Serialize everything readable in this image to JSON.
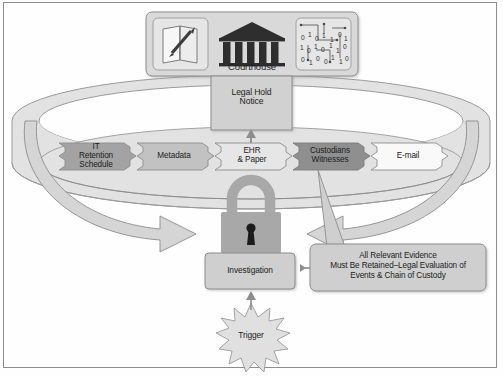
{
  "diagram": {
    "colors": {
      "page_background": "#fefefe",
      "frame_border": "#8e8e8e",
      "ring_fill": "#e2e2e2",
      "ring_stroke": "#9a9a9a",
      "panel_fill": "#d9d9d9",
      "panel_stroke": "#8d8d8d",
      "icon_tile_fill": "#e6e6e6",
      "chevron_light": "#e0e0e0",
      "chevron_mid": "#c2c2c2",
      "chevron_dark": "#a3a3a3",
      "chevron_white": "#f7f7f7",
      "arrow_fill": "#d5d5d5",
      "arrow_stroke": "#8d8d8d",
      "lock_fill": "#a8a8a8",
      "lock_keyhole": "#1c1c1c",
      "box_fill": "#cfcfcf",
      "box_stroke": "#8d8d8d",
      "starburst_fill": "#e0e0e0",
      "text": "#1c1c1c"
    },
    "top_panel": {
      "name": "courthouse-panel",
      "icons": [
        {
          "id": "document-pen-icon",
          "label": ""
        },
        {
          "id": "courthouse-icon",
          "label": "Courthouse"
        },
        {
          "id": "binary-data-icon",
          "label": ""
        }
      ]
    },
    "legal_hold": {
      "label": "Legal Hold\nNotice"
    },
    "chevrons": [
      {
        "id": "it-retention-schedule",
        "label": "IT\nRetention\nSchedule",
        "tone": "dark"
      },
      {
        "id": "metadata",
        "label": "Metadata",
        "tone": "mid"
      },
      {
        "id": "ehr-paper",
        "label": "EHR\n& Paper",
        "tone": "light"
      },
      {
        "id": "custodians-witnesses",
        "label": "Custodians\nWitnesses",
        "tone": "darkest"
      },
      {
        "id": "e-mail",
        "label": "E-mail",
        "tone": "white"
      }
    ],
    "lock": {
      "id": "padlock-icon",
      "label": ""
    },
    "investigation": {
      "label": "Investigation"
    },
    "callout": {
      "label": "All Relevant Evidence\nMust Be Retained–Legal Evaluation of\nEvents & Chain of Custody"
    },
    "trigger": {
      "label": "Trigger"
    },
    "arrows": [
      {
        "id": "arrow-legalhold-up",
        "from": "ehr-paper",
        "to": "legal-hold-notice"
      },
      {
        "id": "arrow-left-to-lock",
        "from": "metadata",
        "to": "padlock"
      },
      {
        "id": "arrow-right-to-lock",
        "from": "custodians-witnesses",
        "to": "padlock"
      },
      {
        "id": "arrow-lock-to-investigation",
        "from": "padlock",
        "to": "investigation"
      },
      {
        "id": "arrow-callout-to-investigation",
        "from": "callout",
        "to": "investigation"
      },
      {
        "id": "arrow-trigger-to-investigation",
        "from": "trigger",
        "to": "investigation"
      }
    ]
  }
}
